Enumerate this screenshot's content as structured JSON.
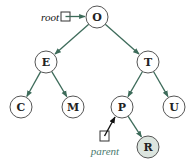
{
  "diagram": {
    "type": "binary-search-tree",
    "colors": {
      "edge": "#3d6b5a",
      "node_stroke": "#555555",
      "node_fill": "#ffffff",
      "highlight_fill": "#dce5df",
      "parent_label": "#4a7a70",
      "root_label": "#111111",
      "parent_arrow": "#111111"
    },
    "nodes": [
      {
        "id": "O",
        "label": "O",
        "x": 97,
        "y": 17,
        "highlight": false
      },
      {
        "id": "E",
        "label": "E",
        "x": 46,
        "y": 62,
        "highlight": false
      },
      {
        "id": "T",
        "label": "T",
        "x": 148,
        "y": 62,
        "highlight": false
      },
      {
        "id": "C",
        "label": "C",
        "x": 21,
        "y": 107,
        "highlight": false
      },
      {
        "id": "M",
        "label": "M",
        "x": 73,
        "y": 107,
        "highlight": false
      },
      {
        "id": "P",
        "label": "P",
        "x": 122,
        "y": 107,
        "highlight": false
      },
      {
        "id": "U",
        "label": "U",
        "x": 174,
        "y": 107,
        "highlight": false
      },
      {
        "id": "R",
        "label": "R",
        "x": 148,
        "y": 147,
        "highlight": true
      }
    ],
    "edges": [
      {
        "from": "O",
        "to": "E"
      },
      {
        "from": "O",
        "to": "T"
      },
      {
        "from": "E",
        "to": "C"
      },
      {
        "from": "E",
        "to": "M"
      },
      {
        "from": "T",
        "to": "P"
      },
      {
        "from": "T",
        "to": "U"
      },
      {
        "from": "P",
        "to": "R"
      }
    ],
    "pointers": [
      {
        "name": "root",
        "label": "root",
        "target": "O"
      },
      {
        "name": "parent",
        "label": "parent",
        "target": "P"
      }
    ]
  }
}
